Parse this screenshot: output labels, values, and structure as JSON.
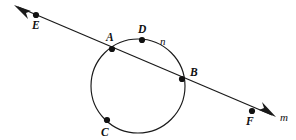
{
  "figure": {
    "kind": "geometry-diagram",
    "canvas": {
      "width": 296,
      "height": 140,
      "background": "#ffffff"
    },
    "ink_color": "#111111",
    "stroke_color": "#1a1a1a"
  },
  "labels": {
    "point_e": "E",
    "point_a": "A",
    "point_d": "D",
    "point_b": "B",
    "point_c": "C",
    "point_f": "F",
    "circle_n": "n",
    "line_m": "m"
  },
  "geometry": {
    "circle": {
      "name": "n",
      "cx": 138,
      "cy": 86,
      "r": 47
    },
    "line": {
      "name": "m",
      "x1": 18,
      "y1": 7,
      "x2": 272,
      "y2": 115,
      "arrow_start": true,
      "arrow_end": true
    },
    "points": [
      {
        "id": "E",
        "x": 36,
        "y": 15,
        "on": "line",
        "label_x": 32,
        "label_y": 29
      },
      {
        "id": "A",
        "x": 112,
        "y": 49,
        "on": "both",
        "label_x": 106,
        "label_y": 41
      },
      {
        "id": "D",
        "x": 142,
        "y": 40,
        "on": "circle",
        "label_x": 138,
        "label_y": 33
      },
      {
        "id": "B",
        "x": 182,
        "y": 79,
        "on": "both",
        "label_x": 190,
        "label_y": 76
      },
      {
        "id": "C",
        "x": 107,
        "y": 120,
        "on": "circle",
        "label_x": 101,
        "label_y": 136
      },
      {
        "id": "F",
        "x": 252,
        "y": 111,
        "on": "line",
        "label_x": 246,
        "label_y": 125
      }
    ],
    "circle_label_position": {
      "x": 160,
      "y": 45
    },
    "line_label_position": {
      "x": 280,
      "y": 121
    },
    "dot_radius": 3.1
  }
}
